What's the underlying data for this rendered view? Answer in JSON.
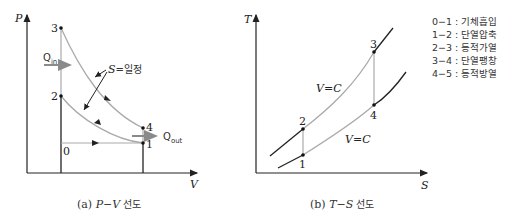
{
  "pv_diagram": {
    "y_axis_label": "P",
    "x_axis_label": "V",
    "points": {
      "p0": "0",
      "p1": "1",
      "p2": "2",
      "p3": "3",
      "p4": "4"
    },
    "q_in": {
      "base": "Q",
      "sub": "in"
    },
    "q_out": {
      "base": "Q",
      "sub": "out"
    },
    "isentropic_label_s": "S",
    "isentropic_label_rest": "=일정",
    "caption_prefix": "(a) ",
    "caption_formula": "P−V",
    "caption_suffix": " 선도"
  },
  "ts_diagram": {
    "y_axis_label": "T",
    "x_axis_label": "S",
    "points": {
      "p1": "1",
      "p2": "2",
      "p3": "3",
      "p4": "4"
    },
    "upper_curve_label": "V=C",
    "lower_curve_label": "V=C",
    "caption_prefix": "(b) ",
    "caption_formula": "T−S",
    "caption_suffix": " 선도"
  },
  "legend": {
    "items": [
      {
        "step": "0−1",
        "desc": "기체흡입"
      },
      {
        "step": "1−2",
        "desc": "단열압축"
      },
      {
        "step": "2−3",
        "desc": "등적가열"
      },
      {
        "step": "3−4",
        "desc": "단열팽창"
      },
      {
        "step": "4−5",
        "desc": "등적방열"
      }
    ]
  },
  "colors": {
    "axis": "#222222",
    "curve": "#aaaaaa",
    "arrow_gray": "#8a8a8a"
  }
}
